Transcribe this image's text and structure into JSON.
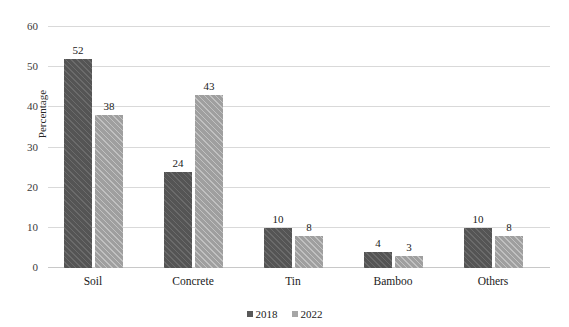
{
  "chart_data": {
    "type": "bar",
    "title": "",
    "subtitle": "",
    "xlabel": "",
    "ylabel": "Percentage",
    "categories": [
      "Soil",
      "Concrete",
      "Tin",
      "Bamboo",
      "Others"
    ],
    "series": [
      {
        "name": "2018",
        "color": "#595959",
        "values": [
          52,
          24,
          10,
          4,
          10
        ]
      },
      {
        "name": "2022",
        "color": "#a6a6a6",
        "values": [
          38,
          43,
          8,
          3,
          8
        ]
      }
    ],
    "data_labels": [
      [
        "52",
        "24",
        "10",
        "4",
        "10"
      ],
      [
        "38",
        "43",
        "8",
        "3",
        "8"
      ]
    ],
    "ylim": [
      0,
      60
    ],
    "ytick_values": [
      0,
      10,
      20,
      30,
      40,
      50,
      60
    ],
    "ytick_labels": [
      "0",
      "10",
      "20",
      "30",
      "40",
      "50",
      "60"
    ],
    "grid": "horizontal",
    "legend_position": "bottom-center",
    "legend_entries": [
      "2018",
      "2022"
    ],
    "grid_color": "#d9d9d9",
    "axis_color": "#c8c8c8",
    "background_color": "#ffffff"
  }
}
